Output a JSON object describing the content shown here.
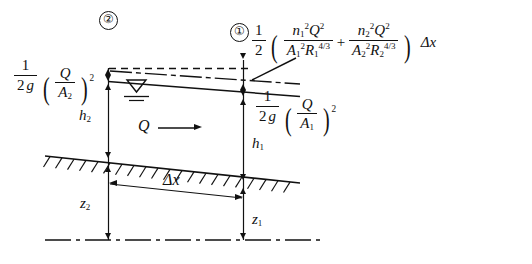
{
  "diagram": {
    "markers": {
      "section_one": "①",
      "section_two": "②"
    },
    "friction_loss_formula": {
      "coefficient_num": "1",
      "coefficient_den": "2",
      "term1_num_n": "n",
      "term1_num_n_sub": "1",
      "term1_num_n_sup": "2",
      "term1_num_Q": "Q",
      "term1_num_Q_sup": "2",
      "term1_den_A": "A",
      "term1_den_A_sub": "1",
      "term1_den_A_sup": "2",
      "term1_den_R": "R",
      "term1_den_R_sub": "1",
      "term1_den_R_sup": "4/3",
      "plus": "+",
      "term2_num_n": "n",
      "term2_num_n_sub": "2",
      "term2_num_n_sup": "2",
      "term2_num_Q": "Q",
      "term2_num_Q_sup": "2",
      "term2_den_A": "A",
      "term2_den_A_sub": "2",
      "term2_den_A_sup": "2",
      "term2_den_R": "R",
      "term2_den_R_sub": "2",
      "term2_den_R_sup": "4/3",
      "tail": "Δx",
      "plain": "1/2 ( n1²Q² / A1²R1^(4/3) + n2²Q² / A2²R2^(4/3) ) Δx"
    },
    "velocity_head_2": {
      "num": "1",
      "den_2": "2",
      "den_g": "g",
      "Q": "Q",
      "A": "A",
      "A_sub": "2",
      "exp": "2",
      "plain": "1/(2g) (Q/A2)²"
    },
    "velocity_head_1": {
      "num": "1",
      "den_2": "2",
      "den_g": "g",
      "Q": "Q",
      "A": "A",
      "A_sub": "1",
      "exp": "2",
      "plain": "1/(2g) (Q/A1)²"
    },
    "depth_2": {
      "sym": "h",
      "sub": "2"
    },
    "depth_1": {
      "sym": "h",
      "sub": "1"
    },
    "elev_2": {
      "sym": "z",
      "sub": "2"
    },
    "elev_1": {
      "sym": "z",
      "sub": "1"
    },
    "discharge": {
      "sym": "Q"
    },
    "reach_length": {
      "sym": "Δx"
    },
    "water_surface_icon": "water-surface-triangle"
  },
  "style": {
    "ink": "#111111"
  }
}
